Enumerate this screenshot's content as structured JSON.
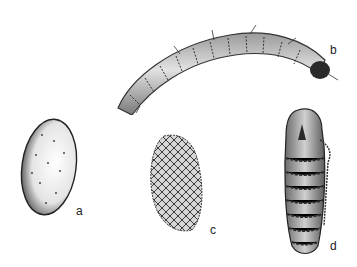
{
  "illustration": {
    "panels": [
      {
        "id": "a",
        "label": "a",
        "subject": "egg"
      },
      {
        "id": "b",
        "label": "b",
        "subject": "larva"
      },
      {
        "id": "c",
        "label": "c",
        "subject": "cocoon"
      },
      {
        "id": "d",
        "label": "d",
        "subject": "pupa"
      }
    ]
  },
  "colors": {
    "ink": "#1a1a1a",
    "shade": "#8a8a8a",
    "light": "#d8d8d8",
    "background": "#ffffff"
  }
}
